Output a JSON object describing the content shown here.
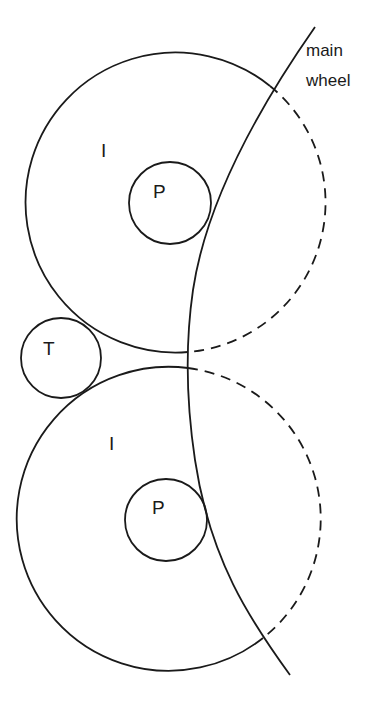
{
  "diagram": {
    "labels": {
      "main_wheel_line1": "main",
      "main_wheel_line2": "wheel",
      "idler_top": "I",
      "pinion_top": "P",
      "transfer": "T",
      "idler_bottom": "I",
      "pinion_bottom": "P"
    },
    "components": [
      {
        "id": "idler-top",
        "label": "I",
        "shape": "circle",
        "center": [
          175,
          202
        ],
        "radius": 150
      },
      {
        "id": "pinion-top",
        "label": "P",
        "shape": "circle",
        "center": [
          170,
          203
        ],
        "radius": 41
      },
      {
        "id": "transfer",
        "label": "T",
        "shape": "circle",
        "center": [
          61,
          358
        ],
        "radius": 40
      },
      {
        "id": "idler-bottom",
        "label": "I",
        "shape": "circle",
        "center": [
          172,
          520
        ],
        "radius": 152
      },
      {
        "id": "pinion-bottom",
        "label": "P",
        "shape": "circle",
        "center": [
          166,
          520
        ],
        "radius": 41
      },
      {
        "id": "main-wheel",
        "label": "main wheel",
        "shape": "arc"
      }
    ],
    "colors": {
      "line": "#1a1a1a",
      "background": "#ffffff"
    }
  }
}
